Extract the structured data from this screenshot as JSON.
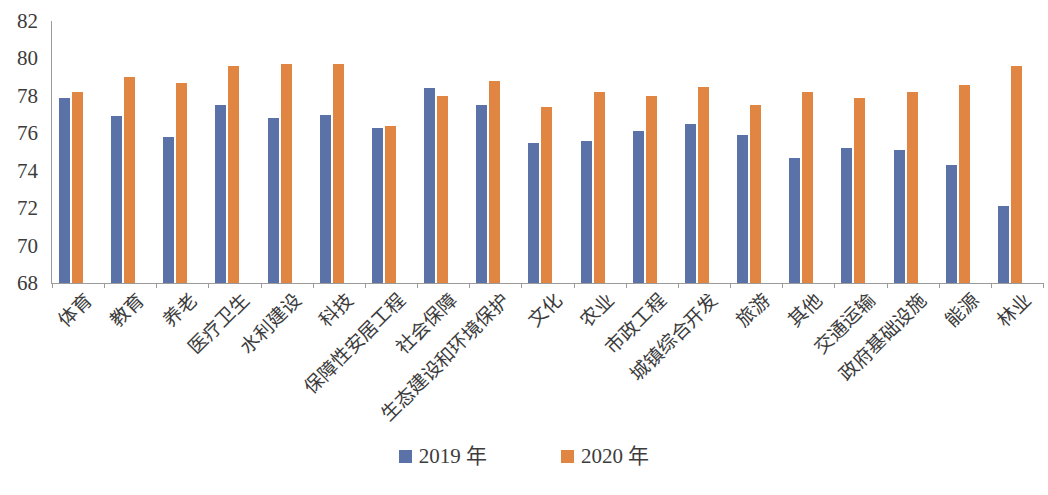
{
  "chart_data": {
    "type": "bar",
    "title": "",
    "subtitle": "",
    "xlabel": "",
    "ylabel": "",
    "ylim": [
      68,
      82
    ],
    "ytick_step": 2,
    "yticks": [
      68,
      70,
      72,
      74,
      76,
      78,
      80,
      82
    ],
    "grid": false,
    "legend_position": "bottom-center",
    "categories": [
      "体育",
      "教育",
      "养老",
      "医疗卫生",
      "水利建设",
      "科技",
      "保障性安居工程",
      "社会保障",
      "生态建设和环境保护",
      "文化",
      "农业",
      "市政工程",
      "城镇综合开发",
      "旅游",
      "其他",
      "交通运输",
      "政府基础设施",
      "能源",
      "林业"
    ],
    "series": [
      {
        "name": "2019 年",
        "color": "#5A72A8",
        "values": [
          77.9,
          76.9,
          75.8,
          77.5,
          76.8,
          77.0,
          76.3,
          78.4,
          77.5,
          75.5,
          75.6,
          76.1,
          76.5,
          75.9,
          74.7,
          75.2,
          75.1,
          74.3,
          72.1
        ]
      },
      {
        "name": "2020 年",
        "color": "#E08542",
        "values": [
          78.2,
          79.0,
          78.7,
          79.6,
          79.7,
          79.7,
          76.4,
          78.0,
          78.8,
          77.4,
          78.2,
          78.0,
          78.5,
          77.5,
          78.2,
          77.9,
          78.2,
          78.6,
          79.6
        ]
      }
    ]
  },
  "legend": {
    "items": [
      {
        "label": "2019 年",
        "color": "#5A72A8"
      },
      {
        "label": "2020 年",
        "color": "#E08542"
      }
    ]
  },
  "axis": {
    "axis_line_color": "#9b9b9b"
  }
}
